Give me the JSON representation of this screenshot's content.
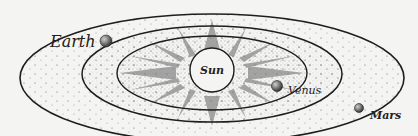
{
  "diagram": {
    "center": {
      "label": "Sun"
    },
    "planets": [
      {
        "label": "Venus",
        "orbit": "inner"
      },
      {
        "label": "Earth",
        "orbit": "middle"
      },
      {
        "label": "Mars",
        "orbit": "outer"
      }
    ],
    "colors": {
      "background": "#f4f4f2",
      "line": "#1e1e1e",
      "stipple": "#6a6a6a",
      "planet": "#7a7a7a"
    }
  }
}
